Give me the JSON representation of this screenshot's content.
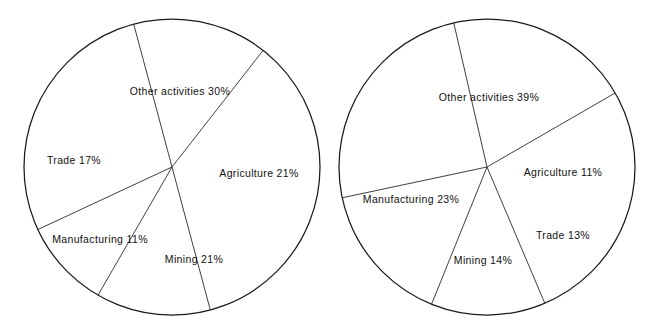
{
  "chart_data": [
    {
      "type": "pie",
      "title": "",
      "name": "pie-chart-left",
      "categories": [
        "Other activities",
        "Agriculture",
        "Mining",
        "Manufacturing",
        "Trade"
      ],
      "values": [
        30,
        21,
        21,
        11,
        17
      ],
      "unit": "%",
      "labels": [
        "Other activities 30%",
        "Agriculture 21%",
        "Mining 21%",
        "Manufacturing 11%",
        "Trade 17%"
      ],
      "legend": "none",
      "grid": false,
      "center": [
        172,
        167
      ],
      "radius": 148,
      "slice_boundaries_deg": [
        52,
        105,
        205,
        240,
        285
      ],
      "label_positions": [
        [
          180,
          91
        ],
        [
          259,
          173
        ],
        [
          194,
          259
        ],
        [
          100,
          239
        ],
        [
          74,
          160
        ]
      ]
    },
    {
      "type": "pie",
      "title": "",
      "name": "pie-chart-right",
      "categories": [
        "Other activities",
        "Agriculture",
        "Trade",
        "Mining",
        "Manufacturing"
      ],
      "values": [
        39,
        11,
        13,
        14,
        23
      ],
      "unit": "%",
      "labels": [
        "Other activities 39%",
        "Agriculture 11%",
        "Trade 13%",
        "Mining 14%",
        "Manufacturing 23%"
      ],
      "legend": "none",
      "grid": false,
      "center": [
        487,
        167
      ],
      "radius": 148,
      "slice_boundaries_deg": [
        30,
        103,
        192,
        248,
        293
      ],
      "label_positions": [
        [
          489,
          97
        ],
        [
          563,
          172
        ],
        [
          563,
          235
        ],
        [
          483,
          260
        ],
        [
          411,
          199
        ]
      ]
    }
  ]
}
